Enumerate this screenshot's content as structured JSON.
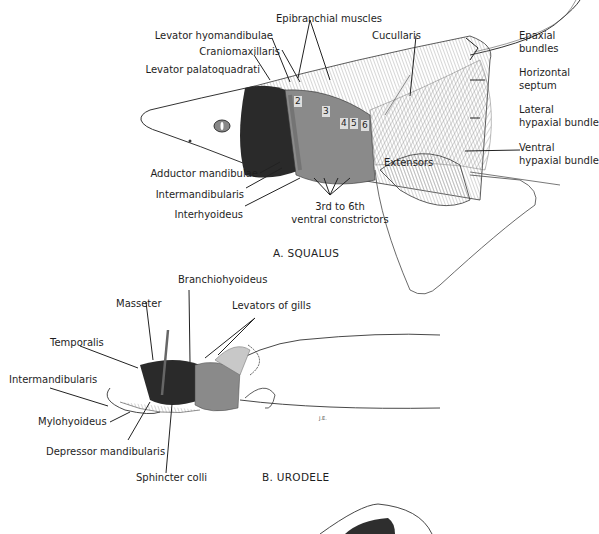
{
  "figure_a": {
    "caption": "A. SQUALUS",
    "labels": {
      "epibranchial": "Epibranchial muscles",
      "lev_hyo": "Levator hyomandibulae",
      "cranio": "Craniomaxillaris",
      "lev_pal": "Levator palatoquadrati",
      "cucullaris": "Cucullaris",
      "epaxial_1": "Epaxial",
      "epaxial_2": "bundles",
      "horiz_1": "Horizontal",
      "horiz_2": "septum",
      "lateral_1": "Lateral",
      "lateral_2": "hypaxial bundle",
      "ventral_1": "Ventral",
      "ventral_2": "hypaxial bundle",
      "extensors": "Extensors",
      "adductor": "Adductor mandibulae",
      "intermand": "Intermandibularis",
      "interhyo": "Interhyoideus",
      "constrictors_1": "3rd to 6th",
      "constrictors_2": "ventral constrictors"
    },
    "gill_numbers": [
      "2",
      "3",
      "4",
      "5",
      "6"
    ]
  },
  "figure_b": {
    "caption": "B. URODELE",
    "labels": {
      "branchiohyoideus": "Branchiohyoideus",
      "masseter": "Masseter",
      "levators_gills": "Levators of gills",
      "temporalis": "Temporalis",
      "intermand": "Intermandibularis",
      "mylohyoideus": "Mylohyoideus",
      "depressor": "Depressor mandibularis",
      "sphincter": "Sphincter colli"
    },
    "signature": "J.E."
  }
}
